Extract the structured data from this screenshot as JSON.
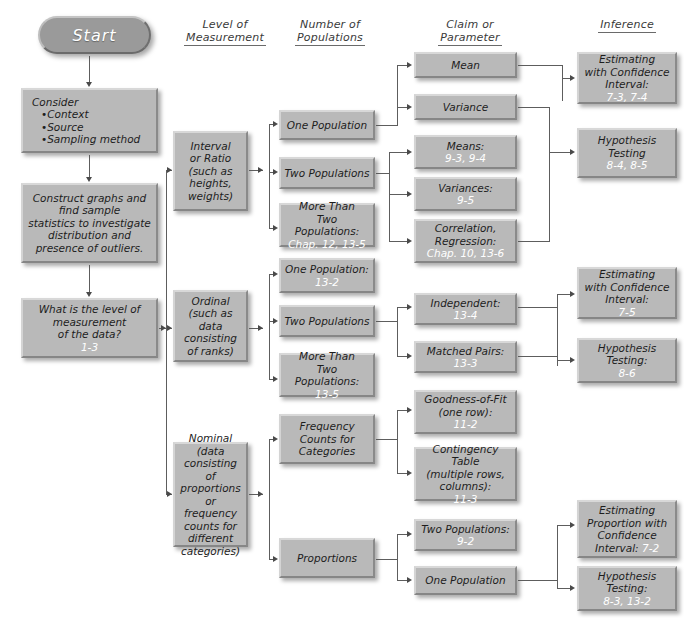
{
  "diagram": {
    "accent_color": "#b9b9b9",
    "ref_color": "#ffffff",
    "line_color": "#5d5d5d"
  },
  "headers": [
    {
      "line1": "Level of",
      "line2": "Measurement"
    },
    {
      "line1": "Number of",
      "line2": "Populations"
    },
    {
      "line1": "Claim or",
      "line2": "Parameter"
    },
    {
      "line1": "",
      "line2": "Inference"
    }
  ],
  "start": {
    "label": "Start"
  },
  "preliminary": [
    {
      "name": "consider",
      "lines": [
        "Consider",
        "•Context",
        "•Source",
        "•Sampling method"
      ],
      "ref": ""
    },
    {
      "name": "construct-graphs",
      "lines": [
        "Construct graphs and",
        "find sample",
        "statistics to investigate",
        "distribution and",
        "presence of outliers."
      ],
      "ref": ""
    },
    {
      "name": "level-question",
      "lines": [
        "What is the level of",
        "measurement",
        "of the data?"
      ],
      "ref": "1-3"
    }
  ],
  "level_of_measurement": [
    {
      "name": "interval-or-ratio",
      "lines": [
        "Interval",
        "or Ratio",
        "(such as",
        "heights,",
        "weights)"
      ],
      "ref": ""
    },
    {
      "name": "ordinal",
      "lines": [
        "Ordinal",
        "(such as data",
        "consisting",
        "of ranks)"
      ],
      "ref": ""
    },
    {
      "name": "nominal",
      "lines": [
        "Nominal",
        "(data consisting",
        "of proportions",
        "or frequency",
        "counts for",
        "different",
        "categories)"
      ],
      "ref": ""
    }
  ],
  "number_of_populations": [
    {
      "name": "one-population-interval",
      "lines": [
        "One Population"
      ],
      "ref": ""
    },
    {
      "name": "two-populations-interval",
      "lines": [
        "Two Populations"
      ],
      "ref": ""
    },
    {
      "name": "more-than-two-populations-interval",
      "lines": [
        "More Than",
        "Two Populations:"
      ],
      "ref": "Chap. 12, 13-5"
    },
    {
      "name": "one-population-ordinal",
      "lines": [
        "One Population:"
      ],
      "ref": "13-2"
    },
    {
      "name": "two-populations-ordinal",
      "lines": [
        "Two Populations"
      ],
      "ref": ""
    },
    {
      "name": "more-than-two-populations-ordinal",
      "lines": [
        "More Than",
        "Two Populations:"
      ],
      "ref": "13-5"
    },
    {
      "name": "frequency-counts-for-categories",
      "lines": [
        "Frequency",
        "Counts for",
        "Categories"
      ],
      "ref": ""
    },
    {
      "name": "proportions",
      "lines": [
        "Proportions"
      ],
      "ref": ""
    }
  ],
  "claim_or_parameter": [
    {
      "name": "mean",
      "lines": [
        "Mean"
      ],
      "ref": ""
    },
    {
      "name": "variance",
      "lines": [
        "Variance"
      ],
      "ref": ""
    },
    {
      "name": "means",
      "lines": [
        "Means:"
      ],
      "ref": "9-3, 9-4"
    },
    {
      "name": "variances",
      "lines": [
        "Variances:"
      ],
      "ref": "9-5"
    },
    {
      "name": "correlation-regression",
      "lines": [
        "Correlation,",
        "Regression:"
      ],
      "ref": "Chap. 10, 13-6"
    },
    {
      "name": "independent",
      "lines": [
        "Independent:"
      ],
      "ref": "13-4"
    },
    {
      "name": "matched-pairs",
      "lines": [
        "Matched Pairs:"
      ],
      "ref": "13-3"
    },
    {
      "name": "goodness-of-fit",
      "lines": [
        "Goodness-of-Fit",
        "(one row):"
      ],
      "ref": "11-2"
    },
    {
      "name": "contingency-table",
      "lines": [
        "Contingency Table",
        "(multiple rows,",
        "columns):"
      ],
      "ref": "11-3"
    },
    {
      "name": "two-populations-proportions",
      "lines": [
        "Two Populations:"
      ],
      "ref": "9-2"
    },
    {
      "name": "one-population-proportions",
      "lines": [
        "One Population"
      ],
      "ref": ""
    }
  ],
  "inference": [
    {
      "name": "estimating-confidence-interval-1",
      "lines": [
        "Estimating",
        "with Confidence",
        "Interval:"
      ],
      "ref": "7-3, 7-4"
    },
    {
      "name": "hypothesis-testing-1",
      "lines": [
        "Hypothesis",
        "Testing"
      ],
      "ref": "8-4, 8-5"
    },
    {
      "name": "estimating-confidence-interval-2",
      "lines": [
        "Estimating",
        "with Confidence",
        "Interval:"
      ],
      "ref": "7-5"
    },
    {
      "name": "hypothesis-testing-2",
      "lines": [
        "Hypothesis",
        "Testing:"
      ],
      "ref": "8-6"
    },
    {
      "name": "estimating-proportion-confidence-interval",
      "lines": [
        "Estimating",
        "Proportion with",
        "Confidence",
        "Interval:"
      ],
      "ref": "7-2"
    },
    {
      "name": "hypothesis-testing-3",
      "lines": [
        "Hypothesis",
        "Testing:"
      ],
      "ref": "8-3, 13-2"
    }
  ]
}
